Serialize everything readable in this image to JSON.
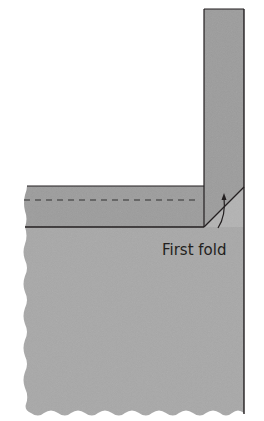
{
  "diagram": {
    "label": "First fold",
    "colors": {
      "background": "#ffffff",
      "fabric_main": "#a7a7a7",
      "binding_strip": "#9a9a9a",
      "fold_triangle": "#b5b5b5",
      "outline": "#231f20",
      "dashed_line": "#555555"
    },
    "parts": [
      {
        "id": "vertical-binding-strip",
        "description": "Binding strip folded up vertically"
      },
      {
        "id": "horizontal-binding-strip",
        "description": "Binding strip along top edge with stitching line"
      },
      {
        "id": "quilt-body",
        "description": "Quilt fabric with wavy cut edges"
      },
      {
        "id": "fold-diagonal",
        "description": "45-degree fold line at corner"
      },
      {
        "id": "fold-arrow",
        "description": "Curved arrow showing fold direction"
      }
    ]
  }
}
